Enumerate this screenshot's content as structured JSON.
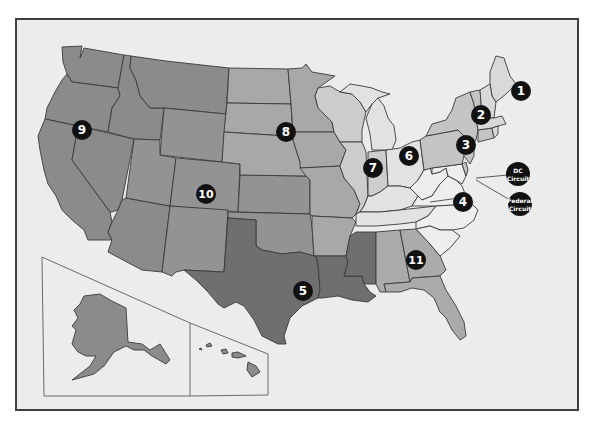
{
  "colors": {
    "page_background": "#ffffff",
    "frame_fill": "#ececec",
    "frame_border": "#3f3f3f",
    "circuit_1": "#d9d9d9",
    "circuit_2": "#c4c4c4",
    "circuit_3": "#c4c4c4",
    "circuit_4": "#eeeeee",
    "circuit_5": "#6f6f6f",
    "circuit_6": "#e2e2e2",
    "circuit_7": "#cdcdcd",
    "circuit_8": "#a8a8a8",
    "circuit_9": "#8b8b8b",
    "circuit_10": "#939393",
    "circuit_11": "#ababab",
    "marker_fill": "#111111",
    "marker_text": "#ffffff"
  },
  "markers": [
    {
      "id": "1",
      "label": "1"
    },
    {
      "id": "2",
      "label": "2"
    },
    {
      "id": "3",
      "label": "3"
    },
    {
      "id": "4",
      "label": "4"
    },
    {
      "id": "5",
      "label": "5"
    },
    {
      "id": "6",
      "label": "6"
    },
    {
      "id": "7",
      "label": "7"
    },
    {
      "id": "8",
      "label": "8"
    },
    {
      "id": "9",
      "label": "9"
    },
    {
      "id": "10",
      "label": "10"
    },
    {
      "id": "11",
      "label": "11"
    },
    {
      "id": "dc",
      "line1": "DC",
      "line2": "Circuit"
    },
    {
      "id": "federal",
      "line1": "Federal",
      "line2": "Circuit"
    }
  ],
  "insets": [
    "Alaska",
    "Hawaii"
  ]
}
